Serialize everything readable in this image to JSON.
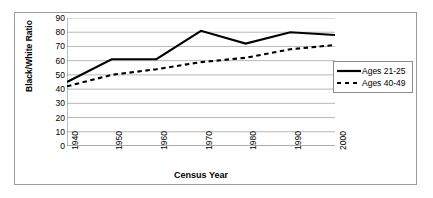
{
  "chart_data": {
    "type": "line",
    "title": "",
    "xlabel": "Census Year",
    "ylabel": "Black/White Ratio",
    "x": [
      1940,
      1950,
      1960,
      1970,
      1980,
      1990,
      2000
    ],
    "categories": [
      "1940",
      "1950",
      "1960",
      "1970",
      "1980",
      "1990",
      "2000"
    ],
    "xlim": [
      1940,
      2000
    ],
    "ylim": [
      0,
      90
    ],
    "ytick_labels": [
      "0",
      "10",
      "20",
      "30",
      "40",
      "50",
      "60",
      "70",
      "80",
      "90"
    ],
    "ytick_values": [
      0,
      10,
      20,
      30,
      40,
      50,
      60,
      70,
      80,
      90
    ],
    "grid": "horizontal",
    "legend_position": "right",
    "series": [
      {
        "name": "Ages 21-25",
        "style": "solid",
        "color": "#000000",
        "values": [
          45,
          61,
          61,
          81,
          72,
          80,
          78
        ]
      },
      {
        "name": "Ages 40-49",
        "style": "dashed",
        "color": "#000000",
        "values": [
          42,
          50,
          54,
          59,
          62,
          68,
          71
        ]
      }
    ]
  },
  "legend": {
    "items": [
      {
        "label": "Ages 21-25"
      },
      {
        "label": "Ages 40-49"
      }
    ]
  },
  "colors": {
    "frame_border": "#9a9a9a",
    "gridline": "#a6a6a6",
    "axis": "#7f7f7f",
    "series": "#000000",
    "background": "#ffffff"
  }
}
